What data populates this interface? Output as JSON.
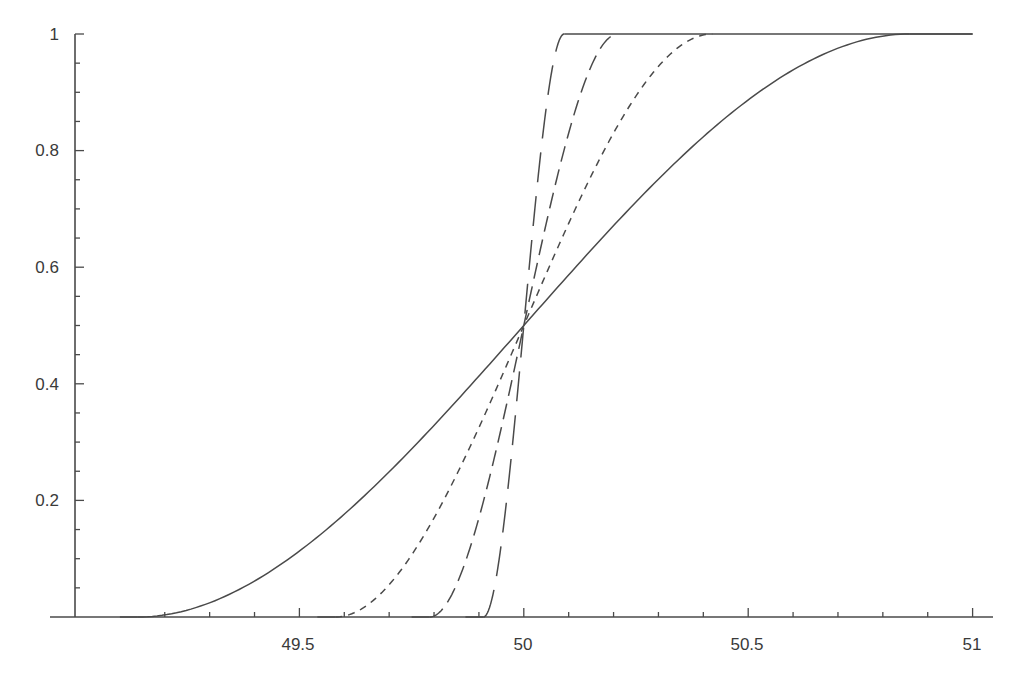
{
  "chart_data": {
    "type": "line",
    "title": "",
    "xlabel": "",
    "ylabel": "",
    "xlim": [
      49.05,
      51.05
    ],
    "ylim": [
      0,
      1
    ],
    "grid": false,
    "legend": null,
    "x_ticks": [
      {
        "value": 49.5,
        "label": "49.5"
      },
      {
        "value": 50,
        "label": "50"
      },
      {
        "value": 50.5,
        "label": "50.5"
      },
      {
        "value": 51,
        "label": "51"
      }
    ],
    "x_minor_step": 0.1,
    "y_ticks": [
      {
        "value": 0.2,
        "label": "0.2"
      },
      {
        "value": 0.4,
        "label": "0.4"
      },
      {
        "value": 0.6,
        "label": "0.6"
      },
      {
        "value": 0.8,
        "label": "0.8"
      },
      {
        "value": 1,
        "label": "1"
      }
    ],
    "y_minor_step": 0.05,
    "y_axis_at_x": 49,
    "series": [
      {
        "name": "curve-solid",
        "style": "solid",
        "center": 50,
        "half_width": 0.86,
        "x_end": 51,
        "points": [
          [
            49.14,
            0
          ],
          [
            49.3,
            0.02
          ],
          [
            49.5,
            0.09
          ],
          [
            49.75,
            0.28
          ],
          [
            50,
            0.5
          ],
          [
            50.25,
            0.72
          ],
          [
            50.5,
            0.91
          ],
          [
            50.7,
            0.98
          ],
          [
            50.86,
            1
          ],
          [
            51,
            1
          ]
        ]
      },
      {
        "name": "curve-short-dash",
        "style": "short-dash",
        "center": 50,
        "half_width": 0.42,
        "x_end": 50.42,
        "points": [
          [
            49.58,
            0
          ],
          [
            49.7,
            0.07
          ],
          [
            49.8,
            0.2
          ],
          [
            49.9,
            0.33
          ],
          [
            50,
            0.5
          ],
          [
            50.1,
            0.67
          ],
          [
            50.2,
            0.8
          ],
          [
            50.3,
            0.93
          ],
          [
            50.42,
            1
          ]
        ]
      },
      {
        "name": "curve-medium-dash",
        "style": "medium-dash",
        "center": 50,
        "half_width": 0.21,
        "x_end": 50.21,
        "points": [
          [
            49.79,
            0
          ],
          [
            49.85,
            0.07
          ],
          [
            49.9,
            0.18
          ],
          [
            49.95,
            0.33
          ],
          [
            50,
            0.5
          ],
          [
            50.05,
            0.67
          ],
          [
            50.1,
            0.82
          ],
          [
            50.15,
            0.93
          ],
          [
            50.21,
            1
          ]
        ]
      },
      {
        "name": "curve-long-dash",
        "style": "long-dash",
        "center": 50,
        "half_width": 0.09,
        "x_end": 51,
        "points": [
          [
            49.91,
            0
          ],
          [
            49.95,
            0.17
          ],
          [
            50,
            0.5
          ],
          [
            50.05,
            0.83
          ],
          [
            50.09,
            1
          ],
          [
            51,
            1
          ]
        ]
      }
    ]
  }
}
